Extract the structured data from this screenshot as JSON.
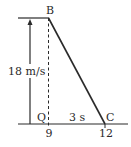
{
  "diagram": {
    "type": "velocity-time graph segment",
    "points": {
      "top": "B",
      "foot": "Q",
      "end": "C"
    },
    "labels": {
      "velocity": "18 m/s",
      "interval": "3 s",
      "tick_start": "9",
      "tick_end": "12"
    },
    "colors": {
      "line": "#2a2a2a",
      "background": "#ffffff"
    }
  }
}
